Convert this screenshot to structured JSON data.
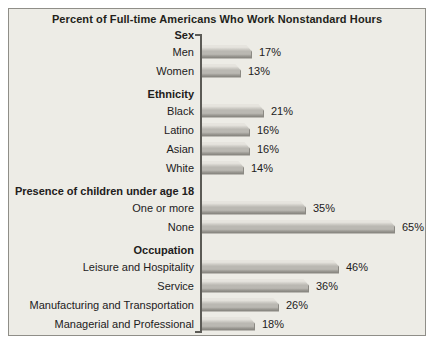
{
  "chart_data": {
    "type": "bar",
    "orientation": "horizontal",
    "title": "Percent of Full-time Americans Who Work Nonstandard Hours",
    "unit": "%",
    "xlim": [
      0,
      70
    ],
    "grid": false,
    "legend": false,
    "groups": [
      {
        "label": "Sex",
        "items": [
          {
            "label": "Men",
            "value": 17
          },
          {
            "label": "Women",
            "value": 13
          }
        ]
      },
      {
        "label": "Ethnicity",
        "items": [
          {
            "label": "Black",
            "value": 21
          },
          {
            "label": "Latino",
            "value": 16
          },
          {
            "label": "Asian",
            "value": 16
          },
          {
            "label": "White",
            "value": 14
          }
        ]
      },
      {
        "label": "Presence of children under age 18",
        "items": [
          {
            "label": "One or more",
            "value": 35
          },
          {
            "label": "None",
            "value": 65
          }
        ]
      },
      {
        "label": "Occupation",
        "items": [
          {
            "label": "Leisure and Hospitality",
            "value": 46
          },
          {
            "label": "Service",
            "value": 36
          },
          {
            "label": "Manufacturing and Transportation",
            "value": 26
          },
          {
            "label": "Managerial and Professional",
            "value": 18
          }
        ]
      }
    ]
  },
  "colors": {
    "panel_bg": "#edece6",
    "panel_border": "#8f8e88",
    "title_text": "#231f1a",
    "text": "#22201b",
    "axis": "#5c5b56",
    "bar_face": "#bab8b2",
    "bar_highlight": "#e6e4de",
    "bar_shadow": "#8b8983"
  }
}
